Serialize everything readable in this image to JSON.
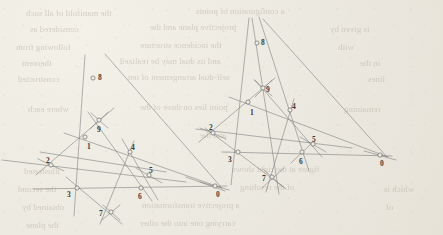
{
  "document": {
    "kind": "scanned-page-figure",
    "description": "Two projective line-arrangement diagrams with labeled intersection points",
    "paper_color": "#efece4",
    "ink_color": "#6f6f72",
    "label_color": "#3a3a3a"
  },
  "figures": [
    {
      "name": "left-configuration",
      "points": [
        {
          "id": "8",
          "label": "8",
          "x": 93,
          "y": 78,
          "lx": 98,
          "ly": 74
        },
        {
          "id": "9",
          "label": "9",
          "x": 99,
          "y": 120,
          "lx": 97,
          "ly": 126
        },
        {
          "id": "1",
          "label": "1",
          "x": 85,
          "y": 137,
          "lx": 87,
          "ly": 143
        },
        {
          "id": "2",
          "label": "2",
          "x": 51,
          "y": 165,
          "lx": 46,
          "ly": 157
        },
        {
          "id": "4",
          "label": "4",
          "x": 130,
          "y": 152,
          "lx": 131,
          "ly": 144
        },
        {
          "id": "5",
          "label": "5",
          "x": 149,
          "y": 175,
          "lx": 149,
          "ly": 167
        },
        {
          "id": "6",
          "label": "6",
          "x": 141,
          "y": 188,
          "lx": 138,
          "ly": 193
        },
        {
          "id": "3",
          "label": "3",
          "x": 77,
          "y": 188,
          "lx": 67,
          "ly": 191
        },
        {
          "id": "7",
          "label": "7",
          "x": 111,
          "y": 212,
          "lx": 99,
          "ly": 210
        },
        {
          "id": "0",
          "label": "0",
          "x": 215,
          "y": 186,
          "lx": 216,
          "ly": 191
        }
      ],
      "lines": [
        {
          "name": "line-8-3-extended",
          "x1": 85,
          "y1": 55,
          "x2": 74,
          "y2": 216
        },
        {
          "name": "line-8-0",
          "x1": 105,
          "y1": 54,
          "x2": 221,
          "y2": 187
        },
        {
          "name": "line-2-5-extended",
          "x1": 2,
          "y1": 160,
          "x2": 186,
          "y2": 182
        },
        {
          "name": "line-3-0-horizontal",
          "x1": 33,
          "y1": 189,
          "x2": 227,
          "y2": 186
        },
        {
          "name": "line-1-4-0",
          "x1": 64,
          "y1": 133,
          "x2": 222,
          "y2": 188
        },
        {
          "name": "line-2-1-9-upper",
          "x1": 36,
          "y1": 175,
          "x2": 114,
          "y2": 108
        },
        {
          "name": "line-9-4-6",
          "x1": 88,
          "y1": 112,
          "x2": 152,
          "y2": 201
        },
        {
          "name": "line-2-3-7-6-5",
          "x1": 40,
          "y1": 152,
          "x2": 166,
          "y2": 172
        },
        {
          "name": "line-3-7",
          "x1": 66,
          "y1": 177,
          "x2": 122,
          "y2": 224
        },
        {
          "name": "line-7-6-4",
          "x1": 100,
          "y1": 224,
          "x2": 134,
          "y2": 141
        },
        {
          "name": "line-4-5-crossing",
          "x1": 122,
          "y1": 139,
          "x2": 158,
          "y2": 200
        },
        {
          "name": "line-through-5",
          "x1": 136,
          "y1": 168,
          "x2": 162,
          "y2": 183
        },
        {
          "name": "line-through-9-a",
          "x1": 91,
          "y1": 113,
          "x2": 108,
          "y2": 128
        },
        {
          "name": "line-through-9-b",
          "x1": 108,
          "y1": 112,
          "x2": 90,
          "y2": 129
        },
        {
          "name": "line-through-7-a",
          "x1": 103,
          "y1": 205,
          "x2": 120,
          "y2": 220
        },
        {
          "name": "line-through-7-b",
          "x1": 120,
          "y1": 205,
          "x2": 102,
          "y2": 220
        },
        {
          "name": "line-through-2-a",
          "x1": 38,
          "y1": 159,
          "x2": 64,
          "y2": 171
        },
        {
          "name": "line-through-0-a",
          "x1": 200,
          "y1": 182,
          "x2": 229,
          "y2": 190
        }
      ]
    },
    {
      "name": "right-configuration",
      "points": [
        {
          "id": "8",
          "label": "8",
          "x": 257,
          "y": 43,
          "lx": 261,
          "ly": 39
        },
        {
          "id": "9",
          "label": "9",
          "x": 263,
          "y": 88,
          "lx": 266,
          "ly": 86
        },
        {
          "id": "1",
          "label": "1",
          "x": 248,
          "y": 102,
          "lx": 250,
          "ly": 109
        },
        {
          "id": "4",
          "label": "4",
          "x": 290,
          "y": 110,
          "lx": 292,
          "ly": 103
        },
        {
          "id": "2",
          "label": "2",
          "x": 213,
          "y": 133,
          "lx": 209,
          "ly": 124
        },
        {
          "id": "5",
          "label": "5",
          "x": 313,
          "y": 144,
          "lx": 312,
          "ly": 136
        },
        {
          "id": "6",
          "label": "6",
          "x": 302,
          "y": 152,
          "lx": 299,
          "ly": 158
        },
        {
          "id": "3",
          "label": "3",
          "x": 238,
          "y": 152,
          "lx": 228,
          "ly": 156
        },
        {
          "id": "7",
          "label": "7",
          "x": 272,
          "y": 177,
          "lx": 262,
          "ly": 175
        },
        {
          "id": "0",
          "label": "0",
          "x": 380,
          "y": 155,
          "lx": 380,
          "ly": 160
        }
      ],
      "lines": [
        {
          "name": "line-8-3-extended",
          "x1": 249,
          "y1": 18,
          "x2": 231,
          "y2": 185
        },
        {
          "name": "line-8-7-extended",
          "x1": 252,
          "y1": 18,
          "x2": 279,
          "y2": 194
        },
        {
          "name": "line-8-6-extended",
          "x1": 259,
          "y1": 17,
          "x2": 309,
          "y2": 171
        },
        {
          "name": "line-8-0",
          "x1": 263,
          "y1": 19,
          "x2": 387,
          "y2": 157
        },
        {
          "name": "line-2-5-extended",
          "x1": 196,
          "y1": 129,
          "x2": 352,
          "y2": 148
        },
        {
          "name": "line-3-0-horizontal",
          "x1": 222,
          "y1": 152,
          "x2": 392,
          "y2": 156
        },
        {
          "name": "line-1-4-0",
          "x1": 229,
          "y1": 97,
          "x2": 388,
          "y2": 157
        },
        {
          "name": "line-2-1-9",
          "x1": 199,
          "y1": 142,
          "x2": 275,
          "y2": 78
        },
        {
          "name": "line-9-4-6-5",
          "x1": 255,
          "y1": 80,
          "x2": 322,
          "y2": 157
        },
        {
          "name": "line-2-3-7",
          "x1": 205,
          "y1": 128,
          "x2": 286,
          "y2": 189
        },
        {
          "name": "line-7-6-4",
          "x1": 266,
          "y1": 192,
          "x2": 294,
          "y2": 99
        },
        {
          "name": "line-through-9-a",
          "x1": 254,
          "y1": 80,
          "x2": 272,
          "y2": 96
        },
        {
          "name": "line-through-9-b",
          "x1": 272,
          "y1": 80,
          "x2": 255,
          "y2": 97
        },
        {
          "name": "line-through-5",
          "x1": 300,
          "y1": 137,
          "x2": 326,
          "y2": 152
        },
        {
          "name": "line-through-6",
          "x1": 291,
          "y1": 163,
          "x2": 313,
          "y2": 142
        },
        {
          "name": "line-through-7-a",
          "x1": 263,
          "y1": 169,
          "x2": 283,
          "y2": 187
        },
        {
          "name": "line-through-7-b",
          "x1": 284,
          "y1": 168,
          "x2": 262,
          "y2": 188
        },
        {
          "name": "line-through-2-a",
          "x1": 200,
          "y1": 128,
          "x2": 226,
          "y2": 139
        },
        {
          "name": "line-through-0-a",
          "x1": 364,
          "y1": 151,
          "x2": 396,
          "y2": 160
        },
        {
          "name": "line-stub-lower-left",
          "x1": 186,
          "y1": 177,
          "x2": 225,
          "y2": 191
        }
      ]
    }
  ],
  "bleedthrough": {
    "note": "faint mirrored text showing through from reverse of page",
    "lines": [
      {
        "text": "the manifold of all such",
        "x": 26,
        "y": 8,
        "size": 9
      },
      {
        "text": "a configuration of points",
        "x": 196,
        "y": 6,
        "size": 9
      },
      {
        "text": "considered as",
        "x": 30,
        "y": 24,
        "size": 9
      },
      {
        "text": "projective plane and the",
        "x": 150,
        "y": 22,
        "size": 9
      },
      {
        "text": "is given by",
        "x": 330,
        "y": 24,
        "size": 9
      },
      {
        "text": "following from",
        "x": 16,
        "y": 42,
        "size": 9
      },
      {
        "text": "the incidence structure",
        "x": 140,
        "y": 40,
        "size": 9
      },
      {
        "text": "with",
        "x": 338,
        "y": 42,
        "size": 9
      },
      {
        "text": "theorem",
        "x": 22,
        "y": 58,
        "size": 9
      },
      {
        "text": "and its dual may be realized",
        "x": 120,
        "y": 56,
        "size": 9
      },
      {
        "text": "in the",
        "x": 360,
        "y": 58,
        "size": 9
      },
      {
        "text": "constructed",
        "x": 18,
        "y": 74,
        "size": 9
      },
      {
        "text": "self-dual arrangement of ten",
        "x": 128,
        "y": 72,
        "size": 9
      },
      {
        "text": "lines",
        "x": 368,
        "y": 74,
        "size": 9
      },
      {
        "text": "where each",
        "x": 28,
        "y": 104,
        "size": 9
      },
      {
        "text": "point lies on three of the",
        "x": 140,
        "y": 102,
        "size": 9
      },
      {
        "text": "remaining",
        "x": 344,
        "y": 104,
        "size": 9
      },
      {
        "text": "and the",
        "x": 200,
        "y": 130,
        "size": 9
      },
      {
        "text": "illustrated",
        "x": 24,
        "y": 166,
        "size": 9
      },
      {
        "text": "figure at the right shows",
        "x": 232,
        "y": 164,
        "size": 9
      },
      {
        "text": "the second",
        "x": 18,
        "y": 184,
        "size": 9
      },
      {
        "text": "of the resulting",
        "x": 240,
        "y": 182,
        "size": 9
      },
      {
        "text": "which is",
        "x": 384,
        "y": 184,
        "size": 9
      },
      {
        "text": "obtained by",
        "x": 22,
        "y": 202,
        "size": 9
      },
      {
        "text": "a projective transformation",
        "x": 142,
        "y": 200,
        "size": 9
      },
      {
        "text": "of",
        "x": 386,
        "y": 202,
        "size": 9
      },
      {
        "text": "the plane",
        "x": 26,
        "y": 220,
        "size": 9
      },
      {
        "text": "carrying one into the other",
        "x": 140,
        "y": 218,
        "size": 9
      }
    ]
  }
}
